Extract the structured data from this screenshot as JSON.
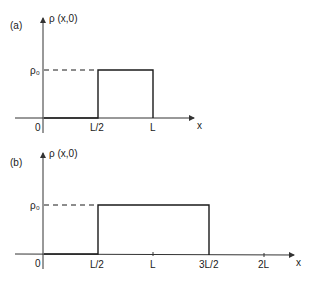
{
  "panels": [
    {
      "id": "a",
      "panel_label": "(a)",
      "y_axis_label": "ρ (x,0)",
      "x_axis_label": "x",
      "level_label": "ρ₀",
      "origin_label": "0",
      "ticks": [
        "L/2",
        "L"
      ],
      "pulse": {
        "start": "L/2",
        "end": "L",
        "height": "ρ₀"
      }
    },
    {
      "id": "b",
      "panel_label": "(b)",
      "y_axis_label": "ρ (x,0)",
      "x_axis_label": "x",
      "level_label": "ρ₀",
      "origin_label": "0",
      "ticks": [
        "L/2",
        "L",
        "3L/2",
        "2L"
      ],
      "pulse": {
        "start": "L/2",
        "end": "3L/2",
        "height": "ρ₀"
      }
    }
  ],
  "colors": {
    "line": "#1a1a1a",
    "axis": "#333333",
    "background": "#ffffff"
  }
}
